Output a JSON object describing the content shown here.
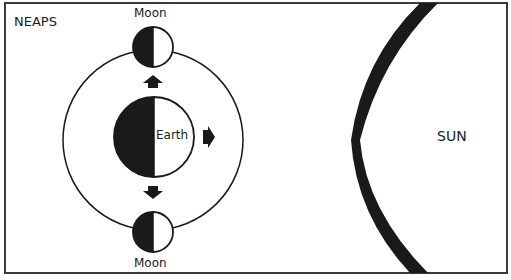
{
  "diagram": {
    "title": "NEAPS",
    "labels": {
      "moon_top": "Moon",
      "moon_bottom": "Moon",
      "earth": "Earth",
      "sun": "SUN"
    },
    "colors": {
      "ink": "#1a1a1a",
      "background": "#ffffff",
      "frame": "#3a3a3a"
    },
    "elements": [
      {
        "id": "earth",
        "shape": "circle",
        "shading": "left half dark (night side)"
      },
      {
        "id": "moon-top",
        "shape": "circle",
        "shading": "left half dark"
      },
      {
        "id": "moon-bottom",
        "shape": "circle",
        "shading": "left half dark"
      },
      {
        "id": "orbit",
        "shape": "circle",
        "description": "Moon orbit around Earth"
      },
      {
        "id": "arrow-up",
        "direction": "up",
        "description": "tidal pull toward top Moon"
      },
      {
        "id": "arrow-down",
        "direction": "down",
        "description": "tidal pull toward bottom Moon"
      },
      {
        "id": "arrow-right",
        "direction": "right",
        "description": "pull toward Sun"
      },
      {
        "id": "sun",
        "shape": "arc",
        "description": "edge of the Sun at right"
      }
    ]
  }
}
